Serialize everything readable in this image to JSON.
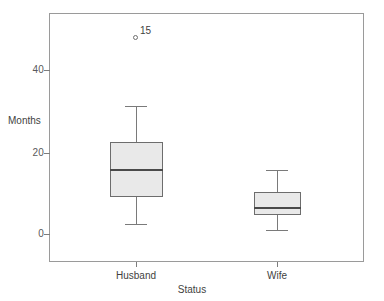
{
  "chart_data": {
    "type": "box",
    "title": "",
    "xlabel": "Status",
    "ylabel": "Months",
    "categories": [
      "Husband",
      "Wife"
    ],
    "ylim": [
      -4,
      53
    ],
    "yticks": [
      0,
      20,
      40
    ],
    "ytick_labels": [
      "0",
      "20",
      "40"
    ],
    "grid": false,
    "legend": "none",
    "boxes": [
      {
        "category": "Husband",
        "min": 2.4,
        "q1": 9.0,
        "median": 15.6,
        "q3": 22.4,
        "max": 31.3,
        "outliers": [
          {
            "value": 47.8,
            "label": "15"
          }
        ]
      },
      {
        "category": "Wife",
        "min": 1.0,
        "q1": 4.6,
        "median": 6.3,
        "q3": 10.2,
        "max": 15.6,
        "outliers": []
      }
    ]
  },
  "axis": {
    "y_title": "Months",
    "x_title": "Status",
    "y_tick_0": "0",
    "y_tick_20": "20",
    "y_tick_40": "40",
    "x_tick_husband": "Husband",
    "x_tick_wife": "Wife"
  },
  "annotations": {
    "outlier_case_label": "15"
  },
  "colors": {
    "box_fill": "#e9e9e9",
    "box_stroke": "#6d6d6d",
    "median_stroke": "#4a4a4a",
    "whisker_stroke": "#7a7a7a",
    "frame_stroke": "#9a9a9a",
    "text": "#3f3f41",
    "tick_text": "#59595b",
    "background": "#ffffff"
  }
}
